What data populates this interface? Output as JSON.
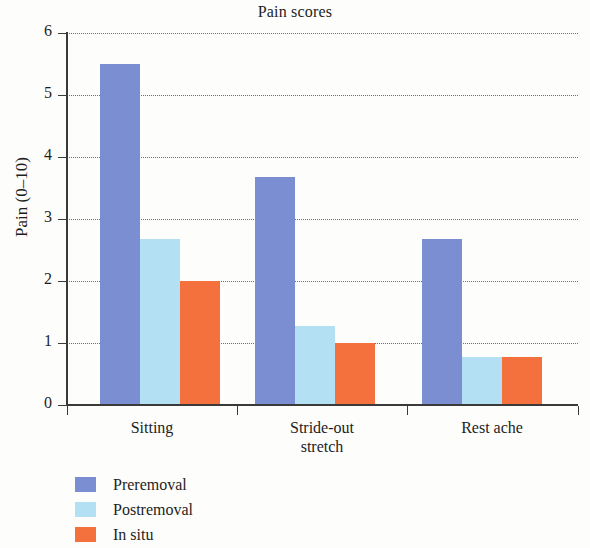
{
  "chart_data": {
    "type": "bar",
    "title": "Pain scores",
    "xlabel": "",
    "ylabel": "Pain (0–10)",
    "categories": [
      "Sitting",
      "Stride-out stretch",
      "Rest ache"
    ],
    "series": [
      {
        "name": "Preremoval",
        "color": "#7b8ed2",
        "values": [
          5.5,
          3.67,
          2.67
        ]
      },
      {
        "name": "Postremoval",
        "color": "#b3e0f2",
        "values": [
          2.68,
          1.28,
          0.78
        ]
      },
      {
        "name": "In situ",
        "color": "#f4713e",
        "values": [
          2.0,
          1.0,
          0.78
        ]
      }
    ],
    "ylim": [
      0,
      6
    ],
    "yticks": [
      0,
      1,
      2,
      3,
      4,
      5,
      6
    ],
    "ytick_labels": [
      "0",
      "1",
      "2",
      "3",
      "4",
      "5",
      "6"
    ],
    "grid": "horizontal-dotted",
    "legend_position": "below-left"
  },
  "axis": {
    "y_tick_labels": [
      "6",
      "5",
      "4",
      "3",
      "2",
      "1",
      "0"
    ],
    "x_tick_labels": [
      {
        "line1": "Sitting",
        "line2": ""
      },
      {
        "line1": "Stride-out",
        "line2": "stretch"
      },
      {
        "line1": "Rest ache",
        "line2": ""
      }
    ]
  },
  "legend": {
    "items": [
      {
        "label": "Preremoval",
        "color": "#7b8ed2"
      },
      {
        "label": "Postremoval",
        "color": "#b3e0f2"
      },
      {
        "label": "In situ",
        "color": "#f4713e"
      }
    ]
  }
}
